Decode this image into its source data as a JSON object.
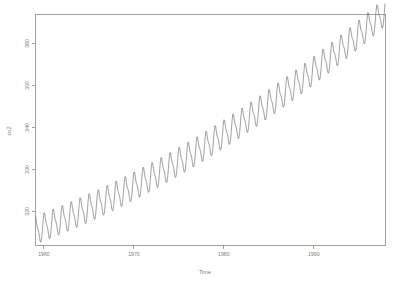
{
  "chart_data": {
    "type": "line",
    "title": "",
    "xlabel": "Time",
    "ylabel": "co2",
    "grid": false,
    "legend": false,
    "xlim": [
      1959.0,
      1997.92
    ],
    "ylim": [
      312.0,
      367.0
    ],
    "xticks": [
      1960,
      1970,
      1980,
      1990
    ],
    "xtick_labels": [
      "1960",
      "1970",
      "1980",
      "1990"
    ],
    "yticks": [
      320,
      330,
      340,
      350,
      360
    ],
    "ytick_labels": [
      "320",
      "330",
      "340",
      "350",
      "360"
    ],
    "line_color": "#6e6e6e",
    "axis_color": "#8a8a8a",
    "text_color": "#7d7d7d",
    "background": "#ffffff",
    "series_name": "co2",
    "x_start": 1959.0,
    "x_step": 0.0833333,
    "n_points": 468,
    "units": "ppm",
    "trend_model": {
      "value_at_start": 315.4,
      "linear_per_year": 0.806,
      "quadratic_per_year2": 0.0136
    },
    "seasonal_amplitude_ppm": 3.05,
    "seasonal_harmonics": [
      {
        "cos": 2.62,
        "sin": 1.55
      },
      {
        "cos": 0.74,
        "sin": -0.36
      },
      {
        "cos": 0.12,
        "sin": 0.16
      }
    ],
    "y_first": 315.42,
    "y_last": 365.0,
    "y_min": 312.98,
    "y_max": 366.8
  },
  "axis": {
    "x_title": "Time",
    "y_title": "co2"
  },
  "plot_geometry": {
    "left": 35,
    "right": 385,
    "top": 14,
    "bottom": 245,
    "width": 409,
    "height": 283
  }
}
